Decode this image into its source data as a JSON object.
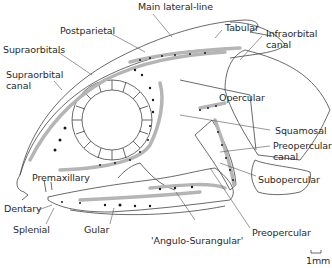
{
  "diagram": {
    "labels": {
      "main_lateral_line": "Main lateral-line",
      "postparietal": "Postparietal",
      "tabular": "Tabular",
      "infraorbital_canal_1": "Infraorbital",
      "infraorbital_canal_2": "canal",
      "supraorbitals": "Supraorbitals",
      "supraorbital_canal_1": "Supraorbital",
      "supraorbital_canal_2": "canal",
      "opercular": "Opercular",
      "squamosal": "Squamosal",
      "preopercular_canal_1": "Preopercular",
      "preopercular_canal_2": "canal",
      "subopercular": "Subopercular",
      "premaxillary": "Premaxillary",
      "dentary": "Dentary",
      "splenial": "Splenial",
      "gular": "Gular",
      "angulo_surangular": "'Angulo-Surangular'",
      "preopercular": "Preopercular"
    },
    "scale_bar": {
      "label": "1mm"
    }
  }
}
